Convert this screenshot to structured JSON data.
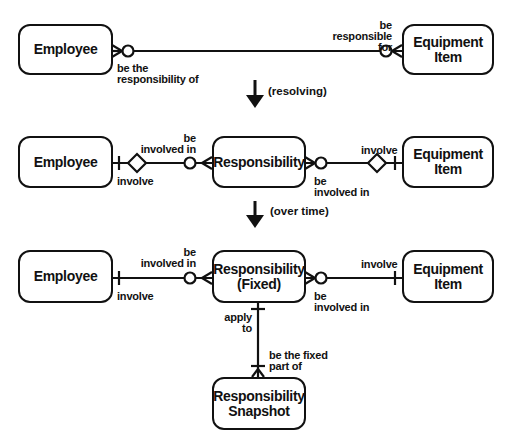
{
  "diagram": {
    "type": "entity-relationship",
    "stages": [
      {
        "id": "original",
        "entities": [
          {
            "id": "employee_1",
            "name": "Employee"
          },
          {
            "id": "equipment_1",
            "name": "Equipment\nItem"
          }
        ],
        "relationships": [
          {
            "from": "employee_1",
            "to": "equipment_1",
            "from_label": "be the\nresponsibility of",
            "from_cardinality": "zero-or-many",
            "to_label": "be\nresponsible for",
            "to_cardinality": "zero-or-many"
          }
        ]
      },
      {
        "id": "resolved",
        "transition_label": "(resolving)",
        "entities": [
          {
            "id": "employee_2",
            "name": "Employee"
          },
          {
            "id": "responsibility_2",
            "name": "Responsibility"
          },
          {
            "id": "equipment_2",
            "name": "Equipment\nItem"
          }
        ],
        "relationships": [
          {
            "from": "employee_2",
            "to": "responsibility_2",
            "from_label": "involve",
            "from_cardinality": "exactly-one (identifying)",
            "to_label": "be\ninvolved in",
            "to_cardinality": "zero-or-many"
          },
          {
            "from": "responsibility_2",
            "to": "equipment_2",
            "from_label": "be\ninvolved in",
            "from_cardinality": "zero-or-many",
            "to_label": "involve",
            "to_cardinality": "exactly-one (identifying)"
          }
        ]
      },
      {
        "id": "over_time",
        "transition_label": "(over time)",
        "entities": [
          {
            "id": "employee_3",
            "name": "Employee"
          },
          {
            "id": "responsibility_fixed",
            "name": "Responsibility\n(Fixed)"
          },
          {
            "id": "equipment_3",
            "name": "Equipment\nItem"
          },
          {
            "id": "responsibility_snapshot",
            "name": "Responsibility\nSnapshot"
          }
        ],
        "relationships": [
          {
            "from": "employee_3",
            "to": "responsibility_fixed",
            "from_label": "involve",
            "from_cardinality": "exactly-one",
            "to_label": "be\ninvolved in",
            "to_cardinality": "zero-or-many"
          },
          {
            "from": "responsibility_fixed",
            "to": "equipment_3",
            "from_label": "be\ninvolved in",
            "from_cardinality": "zero-or-many",
            "to_label": "involve",
            "to_cardinality": "exactly-one"
          },
          {
            "from": "responsibility_fixed",
            "to": "responsibility_snapshot",
            "from_label": "apply\nto",
            "from_cardinality": "exactly-one",
            "to_label": "be the fixed\npart of",
            "to_cardinality": "one-or-many"
          }
        ]
      }
    ]
  },
  "labels": {
    "r1_emp_side": "be the\nresponsibility of",
    "r1_eq_side": "be\nresponsible for",
    "resolving": "(resolving)",
    "r2_emp_involve": "involve",
    "r2_resp_left": "be\ninvolved in",
    "r2_resp_right": "be\ninvolved in",
    "r2_eq_involve": "involve",
    "over_time": "(over time)",
    "r3_emp_involve": "involve",
    "r3_resp_left": "be\ninvolved in",
    "r3_resp_right": "be\ninvolved in",
    "r3_eq_involve": "involve",
    "r3_apply_to": "apply\nto",
    "r3_fixed_part": "be the fixed\npart of"
  },
  "entities": {
    "employee_1": "Employee",
    "equipment_1": "Equipment\nItem",
    "employee_2": "Employee",
    "responsibility_2": "Responsibility",
    "equipment_2": "Equipment\nItem",
    "employee_3": "Employee",
    "responsibility_fixed": "Responsibility\n(Fixed)",
    "equipment_3": "Equipment\nItem",
    "responsibility_snapshot": "Responsibility\nSnapshot"
  },
  "colors": {
    "ink": "#111111",
    "background": "#ffffff"
  }
}
